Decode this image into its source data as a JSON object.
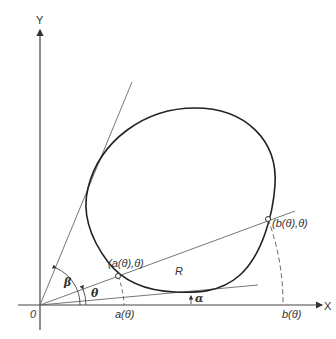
{
  "diagram": {
    "axes": {
      "x_label": "X",
      "y_label": "Y",
      "origin_label": "0"
    },
    "region_label": "R",
    "angles": {
      "alpha": "α",
      "beta": "β",
      "theta": "θ"
    },
    "points": {
      "a_point": "(a(θ),θ)",
      "b_point": "(b(θ),θ)"
    },
    "axis_marks": {
      "a_mark": "a(θ)",
      "b_mark": "b(θ)"
    },
    "colors": {
      "curve": "#222222",
      "lines": "#555555",
      "text": "#333333",
      "background": "#ffffff"
    }
  }
}
